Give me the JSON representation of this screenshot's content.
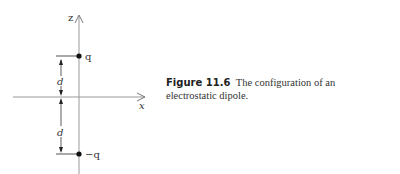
{
  "diagram": {
    "axes": {
      "z_label": "z",
      "x_label": "x"
    },
    "charges": [
      {
        "label": "q",
        "position": "top"
      },
      {
        "label": "−q",
        "position": "bottom"
      }
    ],
    "dimensions": [
      {
        "label": "d",
        "span": "q to origin"
      },
      {
        "label": "d",
        "span": "origin to −q"
      }
    ],
    "colors": {
      "axis": "#999999",
      "ink": "#222222"
    }
  },
  "caption": {
    "figure_number": "Figure 11.6",
    "text": "The configuration of an electrostatic dipole."
  }
}
